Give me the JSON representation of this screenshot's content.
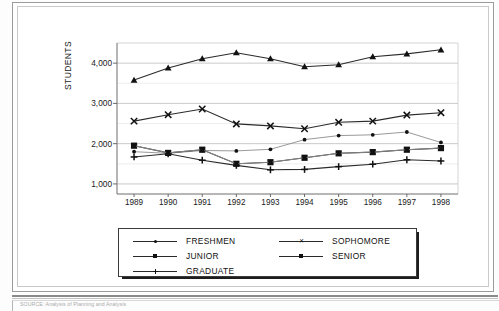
{
  "document": {
    "footnote": "SOURCE: Analysis of Planning and Analysis"
  },
  "chart_data": {
    "type": "line",
    "title": "",
    "xlabel": "",
    "ylabel": "STUDENTS",
    "categories": [
      "1989",
      "1990",
      "1991",
      "1992",
      "1993",
      "1994",
      "1995",
      "1996",
      "1997",
      "1998"
    ],
    "ytick_labels": [
      "1,000",
      "2,000",
      "3,000",
      "4,000"
    ],
    "ytick_values": [
      1000,
      2000,
      3000,
      4000
    ],
    "ylim": [
      750,
      4500
    ],
    "grid": true,
    "legend_position": "bottom",
    "series": [
      {
        "name": "FRESHMEN",
        "marker": "dot",
        "values": [
          1800,
          1760,
          1830,
          1820,
          1860,
          2100,
          2200,
          2220,
          2290,
          2030
        ]
      },
      {
        "name": "SOPHOMORE",
        "marker": "x",
        "values": [
          2560,
          2720,
          2860,
          2490,
          2440,
          2370,
          2530,
          2560,
          2710,
          2770
        ]
      },
      {
        "name": "JUNIOR",
        "marker": "square",
        "values": [
          1950,
          1770,
          1850,
          1500,
          1540,
          1650,
          1760,
          1790,
          1850,
          1890
        ]
      },
      {
        "name": "SENIOR",
        "marker": "square-small",
        "values": [
          1950,
          1770,
          1850,
          1500,
          1540,
          1650,
          1760,
          1790,
          1850,
          1890
        ]
      },
      {
        "name": "GRADUATE",
        "marker": "plus",
        "values": [
          1670,
          1750,
          1590,
          1460,
          1350,
          1360,
          1430,
          1490,
          1600,
          1570
        ]
      },
      {
        "name": "SENIOR_TOP",
        "marker": "triangle",
        "values": [
          3580,
          3880,
          4110,
          4260,
          4110,
          3910,
          3960,
          4160,
          4230,
          4330
        ]
      }
    ]
  },
  "legend": {
    "items": [
      {
        "label": "FRESHMEN",
        "marker": "dot"
      },
      {
        "label": "SOPHOMORE",
        "marker": "x"
      },
      {
        "label": "JUNIOR",
        "marker": "square"
      },
      {
        "label": "SENIOR",
        "marker": "square-small"
      },
      {
        "label": "GRADUATE",
        "marker": "plus"
      }
    ]
  }
}
